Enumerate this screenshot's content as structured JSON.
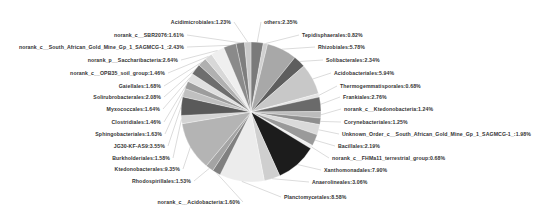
{
  "chart_data": {
    "type": "pie",
    "title": "",
    "start_angle_deg": 0,
    "direction": "clockwise",
    "center": [
      251,
      112
    ],
    "radius": 70,
    "slices": [
      {
        "label": "others",
        "value": 2.35,
        "color": "#7a7a7a"
      },
      {
        "label": "Tepidisphaerales",
        "value": 0.82,
        "color": "#d0d0d0"
      },
      {
        "label": "Rhizobiales",
        "value": 5.78,
        "color": "#a8a8a8"
      },
      {
        "label": "Solibacterales",
        "value": 2.34,
        "color": "#5e5e5e"
      },
      {
        "label": "Acidobacteriales",
        "value": 5.94,
        "color": "#c8c8c8"
      },
      {
        "label": "Thermogemmatisporales",
        "value": 0.68,
        "color": "#e4e4e4"
      },
      {
        "label": "Frankiales",
        "value": 2.76,
        "color": "#6a6a6a"
      },
      {
        "label": "norank_c__Ktedonobacteria",
        "value": 1.24,
        "color": "#bcbcbc"
      },
      {
        "label": "Corynebacteriales",
        "value": 1.25,
        "color": "#8e8e8e"
      },
      {
        "label": "Unknown_Order_c__South_African_Gold_Mine_Gp_1_SAGMCG-1_",
        "value": 1.98,
        "color": "#dadada"
      },
      {
        "label": "Bacillales",
        "value": 2.19,
        "color": "#9a9a9a"
      },
      {
        "label": "norank_c__FHMa11_terrestrial_group",
        "value": 0.68,
        "color": "#f0f0f0"
      },
      {
        "label": "Xanthomonadales",
        "value": 7.9,
        "color": "#1c1c1c"
      },
      {
        "label": "Anaerolineales",
        "value": 3.06,
        "color": "#cfcfcf"
      },
      {
        "label": "Planctomycetales",
        "value": 8.58,
        "color": "#ececec"
      },
      {
        "label": "norank_c__Acidobacteria",
        "value": 1.6,
        "color": "#808080"
      },
      {
        "label": "Rhodospirillales",
        "value": 1.53,
        "color": "#a4a4a4"
      },
      {
        "label": "Ktedonobacterales",
        "value": 9.35,
        "color": "#b4b4b4"
      },
      {
        "label": "Burkholderiales",
        "value": 1.58,
        "color": "#d4d4d4"
      },
      {
        "label": "JG30-KF-AS9",
        "value": 3.55,
        "color": "#5a5a5a"
      },
      {
        "label": "Sphingobacteriales",
        "value": 1.63,
        "color": "#c0c0c0"
      },
      {
        "label": "Clostridiales",
        "value": 1.46,
        "color": "#9c9c9c"
      },
      {
        "label": "Myxococcales",
        "value": 1.64,
        "color": "#e0e0e0"
      },
      {
        "label": "Solirubrobacterales",
        "value": 2.08,
        "color": "#6e6e6e"
      },
      {
        "label": "Gaiellales",
        "value": 1.68,
        "color": "#b0b0b0"
      },
      {
        "label": "norank_c__OPB35_soil_group",
        "value": 1.46,
        "color": "#d8d8d8"
      },
      {
        "label": "norank_p__Saccharibacteria",
        "value": 2.64,
        "color": "#efefef"
      },
      {
        "label": "norank_c__South_African_Gold_Mine_Gp_1_SAGMCG-1_",
        "value": 2.43,
        "color": "#8a8a8a"
      },
      {
        "label": "norank_c__SBR2076",
        "value": 1.61,
        "color": "#7e7e7e"
      },
      {
        "label": "Acidimicrobiales",
        "value": 1.23,
        "color": "#cacaca"
      }
    ],
    "legend": "none (leader-line labels)",
    "labels": [
      {
        "text": "Acidimicrobiales:1.23%",
        "x": 231,
        "y": 22,
        "align": "right"
      },
      {
        "text": "others:2.35%",
        "x": 264,
        "y": 22,
        "align": "left"
      },
      {
        "text": "norank_c__SBR2076:1.61%",
        "x": 184,
        "y": 35,
        "align": "right"
      },
      {
        "text": "Tepidisphaerales:0.82%",
        "x": 302,
        "y": 35,
        "align": "left"
      },
      {
        "text": "norank_c__South_African_Gold_Mine_Gp_1_SAGMCG-1_:2.43%",
        "x": 184,
        "y": 47,
        "align": "right"
      },
      {
        "text": "Rhizobiales:5.78%",
        "x": 318,
        "y": 47,
        "align": "left"
      },
      {
        "text": "norank_p__Saccharibacteria:2.64%",
        "x": 178,
        "y": 60,
        "align": "right"
      },
      {
        "text": "Solibacterales:2.34%",
        "x": 326,
        "y": 60,
        "align": "left"
      },
      {
        "text": "norank_c__OPB35_soil_group:1.46%",
        "x": 165,
        "y": 73,
        "align": "right"
      },
      {
        "text": "Acidobacteriales:5.94%",
        "x": 334,
        "y": 73,
        "align": "left"
      },
      {
        "text": "Gaiellales:1.68%",
        "x": 161,
        "y": 86,
        "align": "right"
      },
      {
        "text": "Thermogemmatisporales:0.68%",
        "x": 340,
        "y": 86,
        "align": "left"
      },
      {
        "text": "Solirubrobacterales:2.08%",
        "x": 161,
        "y": 97,
        "align": "right"
      },
      {
        "text": "Frankiales:2.76%",
        "x": 343,
        "y": 97,
        "align": "left"
      },
      {
        "text": "Myxococcales:1.64%",
        "x": 160,
        "y": 109,
        "align": "right"
      },
      {
        "text": "norank_c__Ktedonobacteria:1.24%",
        "x": 344,
        "y": 109,
        "align": "left"
      },
      {
        "text": "Clostridiales:1.46%",
        "x": 161,
        "y": 122,
        "align": "right"
      },
      {
        "text": "Corynebacteriales:1.25%",
        "x": 344,
        "y": 122,
        "align": "left"
      },
      {
        "text": "Sphingobacteriales:1.63%",
        "x": 162,
        "y": 134,
        "align": "right"
      },
      {
        "text": "Unknown_Order_c__South_African_Gold_Mine_Gp_1_SAGMCG-1_:1.98%",
        "x": 342,
        "y": 134,
        "align": "left"
      },
      {
        "text": "JG30-KF-AS9:3.55%",
        "x": 165,
        "y": 146,
        "align": "right"
      },
      {
        "text": "Bacillales:2.19%",
        "x": 338,
        "y": 146,
        "align": "left"
      },
      {
        "text": "Burkholderiales:1.58%",
        "x": 170,
        "y": 158,
        "align": "right"
      },
      {
        "text": "norank_c__FHMa11_terrestrial_group:0.68%",
        "x": 332,
        "y": 158,
        "align": "left"
      },
      {
        "text": "Ktedonobacterales:9.35%",
        "x": 180,
        "y": 169,
        "align": "right"
      },
      {
        "text": "Xanthomonadales:7.90%",
        "x": 324,
        "y": 170,
        "align": "left"
      },
      {
        "text": "Rhodospirillales:1.53%",
        "x": 191,
        "y": 181,
        "align": "right"
      },
      {
        "text": "Anaerolineales:3.06%",
        "x": 312,
        "y": 182,
        "align": "left"
      },
      {
        "text": "Planctomycetales:8.58%",
        "x": 284,
        "y": 197,
        "align": "left"
      },
      {
        "text": "norank_c__Acidobacteria:1.60%",
        "x": 240,
        "y": 202,
        "align": "right"
      }
    ]
  }
}
